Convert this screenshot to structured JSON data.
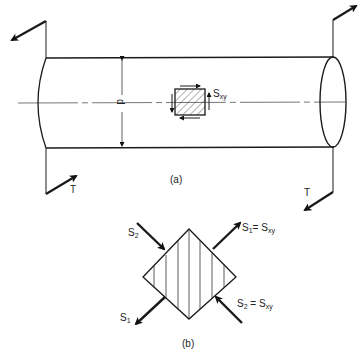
{
  "figure": {
    "part_a": {
      "caption": "(a)",
      "diameter_label": "d",
      "shear_label": "S",
      "shear_sub": "xy",
      "torque_left": "T",
      "torque_right": "T"
    },
    "part_b": {
      "caption": "(b)",
      "s2_top_label": "S",
      "s2_top_sub": "2",
      "s1_right_label": "S",
      "s1_right_sub": "1",
      "s1_right_eq": "= S",
      "s1_right_eq_sub": "xy",
      "s2_right_label": "S",
      "s2_right_sub": "2",
      "s2_right_eq": " = S",
      "s2_right_eq_sub": "xy",
      "s1_left_label": "S",
      "s1_left_sub": "1"
    }
  }
}
